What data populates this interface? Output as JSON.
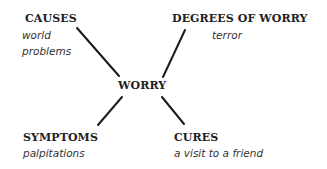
{
  "diagram": {
    "center": {
      "label": "WORRY"
    },
    "branches": [
      {
        "id": "causes",
        "heading": "CAUSES",
        "notes": [
          "world",
          "problems"
        ]
      },
      {
        "id": "degrees",
        "heading": "DEGREES OF WORRY",
        "notes": [
          "terror"
        ]
      },
      {
        "id": "symptoms",
        "heading": "SYMPTOMS",
        "notes": [
          "palpitations"
        ]
      },
      {
        "id": "cures",
        "heading": "CURES",
        "notes": [
          "a visit to a friend"
        ]
      }
    ],
    "line_color": "#1a1a1a"
  }
}
